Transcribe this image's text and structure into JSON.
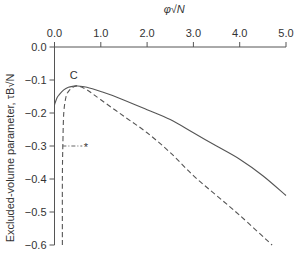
{
  "chart_data": {
    "type": "line",
    "title": "",
    "xlabel": "φ√N",
    "ylabel": "Excluded-volume parameter, τB√N",
    "xlim": [
      0,
      5
    ],
    "ylim": [
      -0.6,
      0
    ],
    "x_axis_position": "top",
    "xticks": [
      "0.0",
      "1.0",
      "2.0",
      "3.0",
      "4.0",
      "5.0"
    ],
    "yticks": [
      "0.0",
      "-0.1",
      "-0.2",
      "-0.3",
      "-0.4",
      "-0.5",
      "-0.6"
    ],
    "grid": false,
    "legend": null,
    "annotations": [
      {
        "text": "C",
        "x": 0.5,
        "y": -0.095
      },
      {
        "text": "*",
        "x": 0.68,
        "y": -0.3,
        "note": "dash-dot guide line from x≈0.17 to x≈0.6 at y=-0.3"
      }
    ],
    "series": [
      {
        "name": "solid",
        "style": "solid",
        "x": [
          0.0,
          0.05,
          0.1,
          0.2,
          0.3,
          0.4,
          0.5,
          0.7,
          1.0,
          1.4,
          2.0,
          2.5,
          3.0,
          3.5,
          4.0,
          4.5,
          5.0
        ],
        "y": [
          -0.175,
          -0.155,
          -0.145,
          -0.13,
          -0.122,
          -0.119,
          -0.118,
          -0.122,
          -0.135,
          -0.155,
          -0.19,
          -0.22,
          -0.26,
          -0.3,
          -0.34,
          -0.39,
          -0.45
        ]
      },
      {
        "name": "dashed",
        "style": "dashed",
        "x": [
          0.17,
          0.17,
          0.18,
          0.2,
          0.25,
          0.3,
          0.4,
          0.5,
          0.7,
          1.0,
          1.5,
          2.0,
          2.5,
          3.0,
          3.5,
          4.0,
          4.7
        ],
        "y": [
          -0.6,
          -0.4,
          -0.3,
          -0.2,
          -0.15,
          -0.135,
          -0.122,
          -0.118,
          -0.13,
          -0.16,
          -0.21,
          -0.26,
          -0.32,
          -0.39,
          -0.45,
          -0.51,
          -0.6
        ]
      }
    ]
  }
}
